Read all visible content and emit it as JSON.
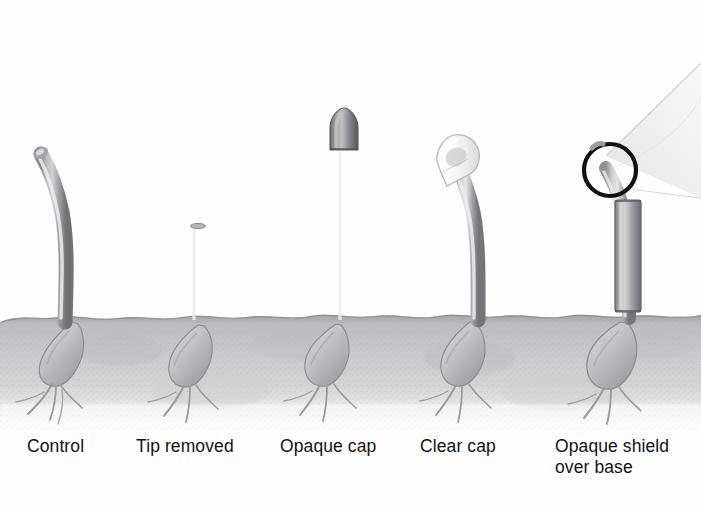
{
  "figure": {
    "background_color": "#fefefe",
    "soil": {
      "name": "soil-bed",
      "top_y": 316,
      "bottom_y": 424,
      "color_top": "#a9a9aa",
      "color_mid": "#c6c6c6",
      "color_bottom": "#f2f2f2"
    },
    "light_direction": "from the upper left",
    "stem_color_dark": "#7c7c7e",
    "stem_color_light": "#d3d3d5",
    "outline_color": "#6d6d70",
    "callout": {
      "name": "magnifier-callout",
      "circle_color": "#111111",
      "cone_color": "#efefef",
      "circle_cx": 610,
      "circle_cy": 170,
      "circle_r": 26
    }
  },
  "specimens": [
    {
      "id": "control",
      "label": "Control",
      "label_x": 27,
      "description": "Intact coleoptile curving toward the light"
    },
    {
      "id": "tip-removed",
      "label": "Tip removed",
      "label_x": 136,
      "description": "Short straight coleoptile with the apical tip cut off; no bending"
    },
    {
      "id": "opaque-cap",
      "label": "Opaque cap",
      "label_x": 280,
      "description": "Coleoptile with a dark opaque cap over the tip; stays straight"
    },
    {
      "id": "clear-cap",
      "label": "Clear cap",
      "label_x": 420,
      "description": "Coleoptile with a transparent cap over the tip; bends toward the light"
    },
    {
      "id": "opaque-shield",
      "label": "Opaque shield\nover base",
      "label_x": 555,
      "description": "Opaque sleeve over the lower stem; tip is exposed and bends toward the light"
    }
  ]
}
